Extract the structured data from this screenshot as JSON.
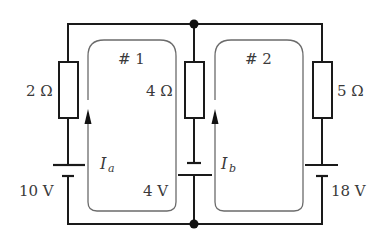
{
  "diagram": {
    "type": "circuit",
    "colors": {
      "wire": "#1a1a1a",
      "loop_path": "#6b6b6b",
      "text": "#3a3a3a",
      "background": "#ffffff"
    },
    "branches": [
      {
        "id": "left",
        "resistor_label": "2 Ω",
        "battery_label": "10 V"
      },
      {
        "id": "middle",
        "resistor_label": "4 Ω",
        "battery_label": "4 V"
      },
      {
        "id": "right",
        "resistor_label": "5 Ω",
        "battery_label": "18 V"
      }
    ],
    "loops": [
      {
        "id": "loop-1",
        "label": "# 1",
        "current_symbol": "I",
        "current_subscript": "a"
      },
      {
        "id": "loop-2",
        "label": "# 2",
        "current_symbol": "I",
        "current_subscript": "b"
      }
    ],
    "junctions": [
      "top-middle",
      "bottom-middle"
    ]
  }
}
